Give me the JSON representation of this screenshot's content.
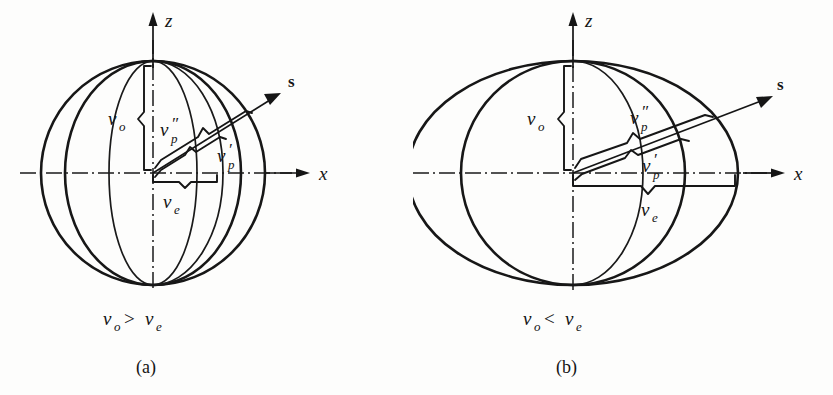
{
  "figure": {
    "type": "optical-indicatrix-wave-velocity-surfaces",
    "background_color": "#fdfdfc",
    "ink_color": "#151515"
  },
  "panels": [
    {
      "id": "a",
      "panel_label": "(a)",
      "relation_text": "v_o > v_e",
      "relation": {
        "left_symbol": "v",
        "left_subscript": "o",
        "operator": ">",
        "right_symbol": "v",
        "right_subscript": "e"
      },
      "surface_kind": "prolate",
      "description": "Sphere (ordinary wave surface) enclosing a prolate spheroid (extraordinary wave surface)",
      "axes": {
        "vertical_label": "z",
        "horizontal_label": "x",
        "ray_label": "s"
      },
      "annotations": [
        {
          "name": "v-o",
          "symbol": "v",
          "subscript": "o",
          "primes": "",
          "meaning": "ordinary wave velocity along z"
        },
        {
          "name": "v-p-double-prime",
          "symbol": "v",
          "subscript": "p",
          "primes": "″",
          "meaning": "faster phase velocity along s"
        },
        {
          "name": "v-p-prime",
          "symbol": "v",
          "subscript": "p",
          "primes": "′",
          "meaning": "slower phase velocity along s"
        },
        {
          "name": "v-e",
          "symbol": "v",
          "subscript": "e",
          "primes": "",
          "meaning": "extraordinary wave velocity along x"
        }
      ],
      "geometry": {
        "center_x": 153,
        "center_y": 173,
        "outer_rx": 112,
        "outer_ry": 112,
        "inner_rx": 88,
        "inner_ry": 112,
        "ray_angle_deg": 27
      }
    },
    {
      "id": "b",
      "panel_label": "(b)",
      "relation_text": "v_o < v_e",
      "relation": {
        "left_symbol": "v",
        "left_subscript": "o",
        "operator": "<",
        "right_symbol": "v",
        "right_subscript": "e"
      },
      "surface_kind": "oblate",
      "description": "Oblate spheroid (extraordinary wave surface) enclosing a sphere (ordinary wave surface)",
      "axes": {
        "vertical_label": "z",
        "horizontal_label": "x",
        "ray_label": "s"
      },
      "annotations": [
        {
          "name": "v-o",
          "symbol": "v",
          "subscript": "o",
          "primes": "",
          "meaning": "ordinary wave velocity along z"
        },
        {
          "name": "v-p-double-prime",
          "symbol": "v",
          "subscript": "p",
          "primes": "″",
          "meaning": "faster phase velocity along s"
        },
        {
          "name": "v-p-prime",
          "symbol": "v",
          "subscript": "p",
          "primes": "′",
          "meaning": "slower phase velocity along s"
        },
        {
          "name": "v-e",
          "symbol": "v",
          "subscript": "e",
          "primes": "",
          "meaning": "extraordinary wave velocity along x"
        }
      ],
      "geometry": {
        "center_x": 160,
        "center_y": 173,
        "outer_rx": 165,
        "outer_ry": 112,
        "inner_rx": 112,
        "inner_ry": 112,
        "ray_angle_deg": 27
      }
    }
  ],
  "glyphs": {
    "prime_single": "′",
    "prime_double": "″",
    "greater_than": ">",
    "less_than": "<"
  }
}
